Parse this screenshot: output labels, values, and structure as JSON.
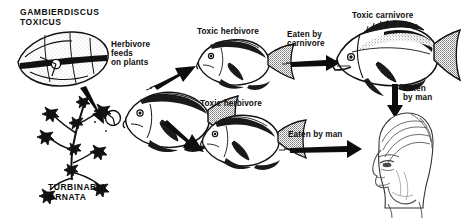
{
  "figure": {
    "background_color": "#ffffff",
    "ink_color": "#0d0d0d",
    "width": 462,
    "height": 218
  },
  "labels": {
    "gambierdiscus": "GAMBIERDISCUS\nTOXICUS",
    "turbinaria": "TURBINARIA\nORNATA",
    "herbivore_feeds": "Herbivore\nfeeds\non plants",
    "toxic_herbivore_top": "Toxic herbivore",
    "toxic_herbivore_bottom": "Toxic herbivore",
    "eaten_by_carnivore": "Eaten by\ncarnivore",
    "toxic_carnivore": "Toxic carnivore",
    "eaten_by_man_vertical": "Eaten\nby man",
    "eaten_by_man_horizontal": "Eaten by man"
  },
  "nodes": [
    {
      "id": "gambierdiscus-toxicus",
      "kind": "dinoflagellate",
      "label": "GAMBIERDISCUS TOXICUS"
    },
    {
      "id": "turbinaria-ornata",
      "kind": "alga",
      "label": "TURBINARIA ORNATA"
    },
    {
      "id": "herbivore-fish",
      "kind": "fish",
      "label": "Herbivore fish"
    },
    {
      "id": "toxic-herbivore-upper",
      "kind": "fish",
      "label": "Toxic herbivore"
    },
    {
      "id": "toxic-herbivore-lower",
      "kind": "fish",
      "label": "Toxic herbivore"
    },
    {
      "id": "toxic-carnivore",
      "kind": "fish",
      "label": "Toxic carnivore"
    },
    {
      "id": "human-head",
      "kind": "person",
      "label": "Man"
    }
  ],
  "arrows": [
    {
      "id": "gambierdiscus-to-alga",
      "from": "gambierdiscus-toxicus",
      "to": "turbinaria-ornata",
      "label": ""
    },
    {
      "id": "plants-to-herbivore",
      "from": "turbinaria-ornata",
      "to": "toxic-herbivore-upper",
      "label": "Herbivore feeds on plants"
    },
    {
      "id": "herbivore-to-lower",
      "from": "herbivore-fish",
      "to": "toxic-herbivore-lower",
      "label": ""
    },
    {
      "id": "herbivore-to-carnivore",
      "from": "toxic-herbivore-upper",
      "to": "toxic-carnivore",
      "label": "Eaten by carnivore"
    },
    {
      "id": "carnivore-to-man",
      "from": "toxic-carnivore",
      "to": "human-head",
      "label": "Eaten by man"
    },
    {
      "id": "herbivore-to-man",
      "from": "toxic-herbivore-lower",
      "to": "human-head",
      "label": "Eaten by man"
    }
  ]
}
